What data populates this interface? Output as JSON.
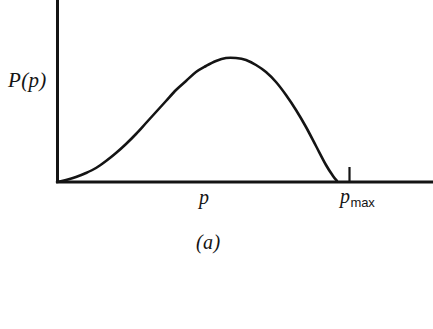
{
  "figure": {
    "caption": "(a)",
    "background_color": "#ffffff",
    "ink_color": "#141414"
  },
  "axes": {
    "y_axis_label": "P(p)",
    "x_axis_label": "p",
    "x_axis_tick_label_base": "p",
    "x_axis_tick_label_sub": "max",
    "origin_x": 57,
    "origin_y": 182,
    "x_axis_end": 433,
    "y_axis_top": 0,
    "tick_x": 349,
    "tick_height": 15
  },
  "chart_data": {
    "type": "line",
    "title": "",
    "subtitle": "",
    "xlabel": "p",
    "ylabel": "P(p)",
    "xlim": [
      0,
      1.35
    ],
    "ylim": [
      0,
      1.1
    ],
    "grid": false,
    "legend": null,
    "annotations": [
      {
        "text": "p",
        "role": "x-axis-variable-label",
        "x_px": 205,
        "y_px": 196
      },
      {
        "text": "p_max",
        "role": "x-axis-tick-label",
        "x_px": 349,
        "y_px": 196
      },
      {
        "text": "P(p)",
        "role": "y-axis-variable-label",
        "x_px": 30,
        "y_px": 82
      },
      {
        "text": "(a)",
        "role": "figure-caption",
        "x_px": 220,
        "y_px": 243
      }
    ],
    "tick_marks": [
      {
        "axis": "x",
        "value_px": 349,
        "label": "p_max"
      }
    ],
    "series": [
      {
        "name": "P(p)",
        "description": "Unimodal probability distribution rising from zero at the origin to a maximum and falling back to zero at p_max",
        "x": [
          0.0,
          0.05,
          0.1,
          0.15,
          0.2,
          0.25,
          0.3,
          0.35,
          0.4,
          0.45,
          0.5,
          0.55,
          0.6,
          0.65,
          0.7,
          0.75,
          0.8,
          0.85,
          0.9,
          0.95,
          1.0
        ],
        "y": [
          0.0,
          0.02,
          0.05,
          0.1,
          0.18,
          0.29,
          0.42,
          0.56,
          0.7,
          0.83,
          0.93,
          0.99,
          1.0,
          0.97,
          0.88,
          0.74,
          0.56,
          0.37,
          0.19,
          0.06,
          0.0
        ]
      }
    ],
    "curve_points_px": [
      [
        57,
        182
      ],
      [
        66,
        180
      ],
      [
        76,
        177
      ],
      [
        86,
        173
      ],
      [
        96,
        168
      ],
      [
        106,
        161
      ],
      [
        116,
        153
      ],
      [
        126,
        144
      ],
      [
        136,
        134
      ],
      [
        146,
        123
      ],
      [
        156,
        112
      ],
      [
        166,
        101
      ],
      [
        176,
        90
      ],
      [
        186,
        81
      ],
      [
        196,
        72
      ],
      [
        206,
        66
      ],
      [
        216,
        61
      ],
      [
        226,
        58
      ],
      [
        236,
        58
      ],
      [
        246,
        60
      ],
      [
        256,
        65
      ],
      [
        266,
        72
      ],
      [
        276,
        82
      ],
      [
        286,
        95
      ],
      [
        296,
        110
      ],
      [
        306,
        127
      ],
      [
        316,
        146
      ],
      [
        326,
        165
      ],
      [
        333,
        176
      ],
      [
        337,
        181
      ]
    ]
  }
}
